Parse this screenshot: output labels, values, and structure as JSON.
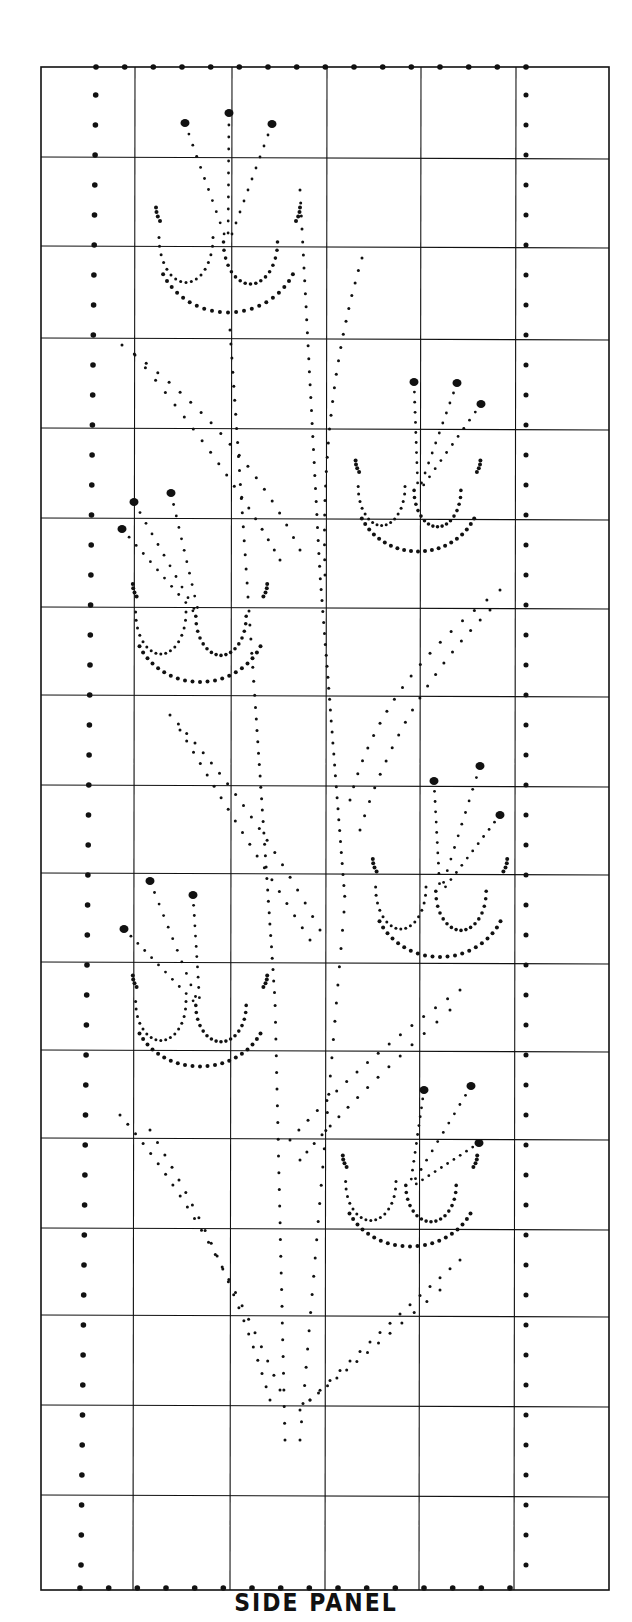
{
  "title": "SIDE PANEL",
  "colors": {
    "ink": "#111111",
    "paper": "#ffffff"
  },
  "grid": {
    "left": 41,
    "right": 609,
    "top": 67,
    "bottom": 1590,
    "columns_x": [
      41,
      135,
      232,
      327,
      421,
      516,
      609
    ],
    "rows_y": [
      67,
      157,
      246,
      338,
      428,
      518,
      607,
      695,
      785,
      873,
      962,
      1050,
      1138,
      1228,
      1315,
      1405,
      1495,
      1590
    ],
    "cols": 6,
    "rows": 17
  },
  "border_dots": {
    "left_x": 96,
    "right_x": 526,
    "top_y": 67,
    "bottom_y": 1588,
    "spacing": 30,
    "radius": 2.8
  },
  "flowers": [
    {
      "name": "flower-top-center",
      "cx": 228,
      "cy": 230,
      "w": 150,
      "h": 150,
      "stamens": [
        [
          185,
          123
        ],
        [
          229,
          113
        ],
        [
          272,
          124
        ]
      ]
    },
    {
      "name": "flower-upper-right",
      "cx": 418,
      "cy": 480,
      "w": 130,
      "h": 130,
      "stamens": [
        [
          414,
          382
        ],
        [
          457,
          383
        ],
        [
          481,
          404
        ]
      ]
    },
    {
      "name": "flower-mid-left",
      "cx": 200,
      "cy": 605,
      "w": 140,
      "h": 140,
      "stamens": [
        [
          134,
          502
        ],
        [
          171,
          493
        ],
        [
          122,
          529
        ]
      ]
    },
    {
      "name": "flower-mid-right",
      "cx": 440,
      "cy": 880,
      "w": 140,
      "h": 140,
      "stamens": [
        [
          434,
          781
        ],
        [
          480,
          766
        ],
        [
          500,
          815
        ]
      ]
    },
    {
      "name": "flower-lower-left",
      "cx": 200,
      "cy": 995,
      "w": 140,
      "h": 130,
      "stamens": [
        [
          150,
          881
        ],
        [
          193,
          895
        ],
        [
          124,
          929
        ]
      ]
    },
    {
      "name": "flower-lower-right",
      "cx": 410,
      "cy": 1175,
      "w": 140,
      "h": 130,
      "stamens": [
        [
          424,
          1090
        ],
        [
          471,
          1086
        ],
        [
          479,
          1143
        ]
      ]
    }
  ],
  "stems": [
    {
      "name": "stem-main-left",
      "points": [
        [
          230,
          330
        ],
        [
          255,
          700
        ],
        [
          275,
          1000
        ],
        [
          285,
          1440
        ]
      ]
    },
    {
      "name": "stem-main-right",
      "points": [
        [
          300,
          190
        ],
        [
          320,
          575
        ],
        [
          345,
          900
        ],
        [
          300,
          1440
        ]
      ]
    },
    {
      "name": "leaf-upper-left",
      "points": [
        [
          122,
          345
        ],
        [
          240,
          430
        ],
        [
          300,
          550
        ]
      ]
    },
    {
      "name": "leaf-upper-left-2",
      "points": [
        [
          135,
          355
        ],
        [
          230,
          470
        ],
        [
          280,
          560
        ]
      ]
    },
    {
      "name": "leaf-top-right",
      "points": [
        [
          362,
          258
        ],
        [
          320,
          400
        ],
        [
          325,
          575
        ]
      ]
    },
    {
      "name": "leaf-mid-right",
      "points": [
        [
          500,
          590
        ],
        [
          380,
          680
        ],
        [
          350,
          800
        ]
      ]
    },
    {
      "name": "leaf-mid-right-2",
      "points": [
        [
          490,
          610
        ],
        [
          400,
          700
        ],
        [
          360,
          830
        ]
      ]
    },
    {
      "name": "leaf-mid-left",
      "points": [
        [
          170,
          715
        ],
        [
          250,
          800
        ],
        [
          320,
          930
        ]
      ]
    },
    {
      "name": "leaf-mid-left-2",
      "points": [
        [
          180,
          730
        ],
        [
          240,
          830
        ],
        [
          310,
          940
        ]
      ]
    },
    {
      "name": "leaf-lower-right",
      "points": [
        [
          460,
          990
        ],
        [
          360,
          1060
        ],
        [
          290,
          1140
        ]
      ]
    },
    {
      "name": "leaf-lower-right-2",
      "points": [
        [
          450,
          1010
        ],
        [
          350,
          1100
        ],
        [
          300,
          1160
        ]
      ]
    },
    {
      "name": "leaf-lower-left",
      "points": [
        [
          120,
          1115
        ],
        [
          210,
          1220
        ],
        [
          280,
          1390
        ]
      ]
    },
    {
      "name": "leaf-lower-left-2",
      "points": [
        [
          150,
          1130
        ],
        [
          230,
          1260
        ],
        [
          270,
          1400
        ]
      ]
    },
    {
      "name": "leaf-bottom-right",
      "points": [
        [
          460,
          1260
        ],
        [
          380,
          1330
        ],
        [
          300,
          1410
        ]
      ]
    },
    {
      "name": "leaf-bottom-right-2",
      "points": [
        [
          440,
          1290
        ],
        [
          360,
          1360
        ],
        [
          310,
          1400
        ]
      ]
    }
  ]
}
